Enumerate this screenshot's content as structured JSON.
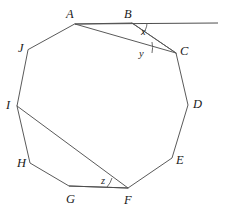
{
  "figure": {
    "type": "geometry-diagram",
    "shape": "decagon",
    "width": 225,
    "height": 215,
    "background_color": "#ffffff",
    "stroke_color": "#5a5a5a",
    "label_color": "#1a1a1a"
  },
  "vertices": [
    {
      "label": "A",
      "x": 75,
      "y": 24,
      "label_x": 66,
      "label_y": 8
    },
    {
      "label": "B",
      "x": 132,
      "y": 23,
      "label_x": 124,
      "label_y": 8
    },
    {
      "label": "C",
      "x": 176,
      "y": 53,
      "label_x": 180,
      "label_y": 45
    },
    {
      "label": "D",
      "x": 188,
      "y": 105,
      "label_x": 193,
      "label_y": 98
    },
    {
      "label": "E",
      "x": 172,
      "y": 158,
      "label_x": 176,
      "label_y": 154
    },
    {
      "label": "F",
      "x": 128,
      "y": 188,
      "label_x": 124,
      "label_y": 194
    },
    {
      "label": "G",
      "x": 69,
      "y": 186,
      "label_x": 66,
      "label_y": 193
    },
    {
      "label": "H",
      "x": 30,
      "y": 163,
      "label_x": 17,
      "label_y": 157
    },
    {
      "label": "I",
      "x": 17,
      "y": 106,
      "label_x": 6,
      "label_y": 99
    },
    {
      "label": "J",
      "x": 28,
      "y": 50,
      "label_x": 18,
      "label_y": 42
    }
  ],
  "polygon_path": "M 75,24 L 132,23 L 176,53 L 188,105 L 172,158 L 128,188 L 69,186 L 30,163 L 17,106 L 28,50 Z",
  "chords": [
    {
      "name": "chord-AC",
      "from": "A",
      "to": "C",
      "x1": 75,
      "y1": 24,
      "x2": 176,
      "y2": 53
    },
    {
      "name": "chord-BC",
      "from": "B",
      "to": "C",
      "x1": 132,
      "y1": 23,
      "x2": 176,
      "y2": 53
    },
    {
      "name": "chord-IF",
      "from": "I",
      "to": "F",
      "x1": 17,
      "y1": 106,
      "x2": 128,
      "y2": 188
    }
  ],
  "extension_line": {
    "name": "extension-line-through-AB",
    "x1": 75,
    "y1": 24,
    "x2": 218,
    "y2": 23
  },
  "angles": [
    {
      "label": "x",
      "vertex": "B",
      "description": "angle between BC and the extension of AB beyond B",
      "label_x": 141,
      "label_y": 27,
      "arc_path": "M 146,23 A 14,14 0 0 1 141,33"
    },
    {
      "label": "y",
      "vertex": "C",
      "description": "angle ACB between CA and CB",
      "label_x": 139,
      "label_y": 49,
      "arc_path": "M 155,45 A 22,22 0 0 1 154,53"
    },
    {
      "label": "z",
      "vertex": "F",
      "description": "angle GFI between FG and FI",
      "label_x": 101,
      "label_y": 176,
      "arc_path": "M 108,187 A 20,20 0 0 0 111,179"
    }
  ],
  "highlighted_segments": [
    {
      "name": "segment-GF",
      "from": "G",
      "to": "F",
      "x1": 69,
      "y1": 186,
      "x2": 128,
      "y2": 188
    }
  ]
}
